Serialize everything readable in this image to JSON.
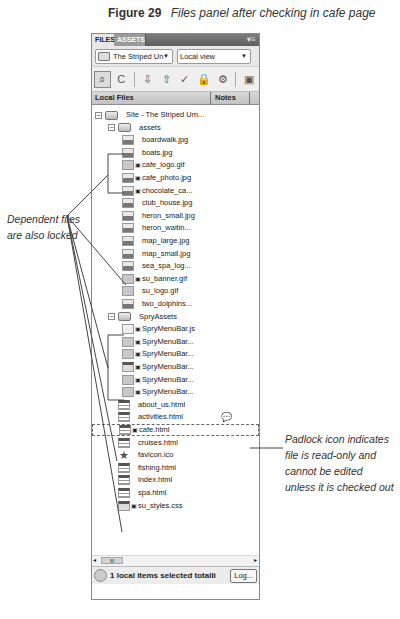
{
  "caption": {
    "number": "Figure 29",
    "text": "Files panel after checking in cafe page"
  },
  "panel": {
    "tabs": [
      {
        "label": "FILES",
        "active": true
      },
      {
        "label": "ASSETS",
        "active": false
      }
    ],
    "tab_menu_icon": "panel-menu-icon",
    "site_select": {
      "value": "The Striped Un"
    },
    "view_select": {
      "value": "Local view"
    },
    "toolbar": [
      {
        "name": "connect-icon",
        "glyph": "⌕",
        "pressed": true
      },
      {
        "name": "refresh-icon",
        "glyph": "C"
      },
      {
        "name": "get-files-icon",
        "glyph": "⇩"
      },
      {
        "name": "put-files-icon",
        "glyph": "⇧"
      },
      {
        "name": "check-out-icon",
        "glyph": "✓"
      },
      {
        "name": "check-in-icon",
        "glyph": "🔒"
      },
      {
        "name": "synchronize-icon",
        "glyph": "⚙"
      },
      {
        "name": "expand-icon",
        "glyph": "▣"
      }
    ],
    "columns": {
      "local_files": "Local Files",
      "notes": "Notes"
    },
    "tree": [
      {
        "label": "Site - The Striped Um...",
        "type": "folder",
        "level": 0,
        "expander": "−",
        "locked": false
      },
      {
        "label": "assets",
        "type": "folder",
        "level": 1,
        "expander": "−",
        "locked": false
      },
      {
        "label": "boardwalk.jpg",
        "type": "img",
        "level": 2,
        "locked": false
      },
      {
        "label": "boats.jpg",
        "type": "img",
        "level": 2,
        "locked": false
      },
      {
        "label": "cafe_logo.gif",
        "type": "gif",
        "level": 2,
        "locked": true
      },
      {
        "label": "cafe_photo.jpg",
        "type": "img",
        "level": 2,
        "locked": true
      },
      {
        "label": "chocolate_ca...",
        "type": "img",
        "level": 2,
        "locked": true
      },
      {
        "label": "club_house.jpg",
        "type": "img",
        "level": 2,
        "locked": false
      },
      {
        "label": "heron_small.jpg",
        "type": "img",
        "level": 2,
        "locked": false
      },
      {
        "label": "heron_waitin...",
        "type": "img",
        "level": 2,
        "locked": false
      },
      {
        "label": "map_large.jpg",
        "type": "img",
        "level": 2,
        "locked": false
      },
      {
        "label": "map_small.jpg",
        "type": "img",
        "level": 2,
        "locked": false
      },
      {
        "label": "sea_spa_log...",
        "type": "img",
        "level": 2,
        "locked": false
      },
      {
        "label": "su_banner.gif",
        "type": "gif",
        "level": 2,
        "locked": true
      },
      {
        "label": "su_logo.gif",
        "type": "gif",
        "level": 2,
        "locked": false
      },
      {
        "label": "two_dolphins...",
        "type": "img",
        "level": 2,
        "locked": false
      },
      {
        "label": "SpryAssets",
        "type": "folder",
        "level": 1,
        "expander": "−",
        "locked": false
      },
      {
        "label": "SpryMenuBar.js",
        "type": "js",
        "level": 2,
        "locked": true
      },
      {
        "label": "SpryMenuBar...",
        "type": "gif",
        "level": 2,
        "locked": true
      },
      {
        "label": "SpryMenuBar...",
        "type": "gif",
        "level": 2,
        "locked": true
      },
      {
        "label": "SpryMenuBar...",
        "type": "css",
        "level": 2,
        "locked": true
      },
      {
        "label": "SpryMenuBar...",
        "type": "gif",
        "level": 2,
        "locked": true
      },
      {
        "label": "SpryMenuBar...",
        "type": "gif",
        "level": 2,
        "locked": true
      },
      {
        "label": "about_us.html",
        "type": "html",
        "level": 1,
        "locked": false
      },
      {
        "label": "activities.html",
        "type": "html",
        "level": 1,
        "locked": false,
        "note": true
      },
      {
        "label": "cafe.html",
        "type": "html",
        "level": 1,
        "locked": true,
        "selected": true
      },
      {
        "label": "cruises.html",
        "type": "html",
        "level": 1,
        "locked": false
      },
      {
        "label": "favicon.ico",
        "type": "ico",
        "level": 1,
        "locked": false
      },
      {
        "label": "fishing.html",
        "type": "html",
        "level": 1,
        "locked": false
      },
      {
        "label": "index.html",
        "type": "html",
        "level": 1,
        "locked": false
      },
      {
        "label": "spa.html",
        "type": "html",
        "level": 1,
        "locked": false
      },
      {
        "label": "su_styles.css",
        "type": "css",
        "level": 1,
        "locked": true
      }
    ],
    "note_icon": "💬",
    "lock_glyph": "🔒",
    "scrollbar": {
      "thumb_glyph": "III",
      "left_arrow": "◂",
      "right_arrow": "▸"
    },
    "status": {
      "text": "1 local items selected totalli",
      "log_button": "Log..."
    }
  },
  "annotations": {
    "left": "Dependent files are also locked",
    "right": "Padlock icon indicates file is read-only and cannot be edited unless it is checked out"
  }
}
